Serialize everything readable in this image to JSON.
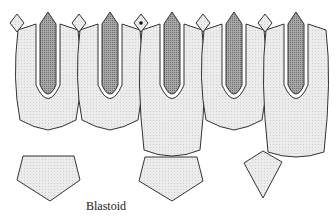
{
  "diagram": {
    "caption": "Blastoid",
    "colors": {
      "plate_fill": "#e6e6e6",
      "ambulacrum_fill": "#9a9a9a",
      "outline": "#333333",
      "background": "#ffffff"
    },
    "components": {
      "columns": 5,
      "deltoid_diamonds": 5,
      "marked_diamond_index": 2,
      "basal_plates": [
        "pentagon",
        "pentagon",
        "kite"
      ]
    }
  }
}
